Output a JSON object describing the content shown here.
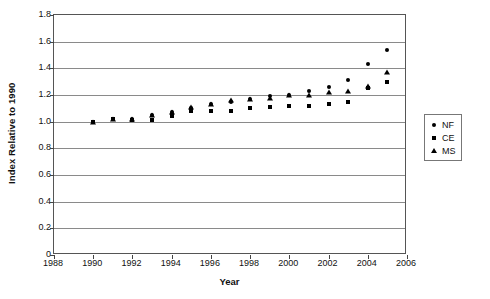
{
  "chart_data": {
    "type": "scatter",
    "title": "",
    "xlabel": "Year",
    "ylabel": "Index Relative to 1990",
    "xlim": [
      1988,
      2006
    ],
    "ylim": [
      0,
      1.8
    ],
    "xticks": [
      1988,
      1990,
      1992,
      1994,
      1996,
      1998,
      2000,
      2002,
      2004,
      2006
    ],
    "yticks": [
      "0",
      "0.2",
      "0.4",
      "0.6",
      "0.8",
      "1.0",
      "1.2",
      "1.4",
      "1.6",
      "1.8"
    ],
    "grid": "horizontal",
    "legend_position": "right-outside",
    "legend": [
      "NF",
      "CE",
      "MS"
    ],
    "x": [
      1990,
      1991,
      1992,
      1993,
      1994,
      1995,
      1996,
      1997,
      1998,
      1999,
      2000,
      2001,
      2002,
      2003,
      2004,
      2005
    ],
    "series": [
      {
        "name": "NF",
        "marker": "circle",
        "values": [
          1.0,
          1.02,
          1.02,
          1.05,
          1.07,
          1.1,
          1.13,
          1.15,
          1.17,
          1.19,
          1.2,
          1.23,
          1.26,
          1.31,
          1.43,
          1.54
        ]
      },
      {
        "name": "CE",
        "marker": "square",
        "values": [
          1.0,
          1.02,
          1.01,
          1.01,
          1.04,
          1.08,
          1.08,
          1.08,
          1.1,
          1.11,
          1.12,
          1.12,
          1.13,
          1.15,
          1.25,
          1.3
        ]
      },
      {
        "name": "MS",
        "marker": "triangle",
        "values": [
          1.0,
          1.02,
          1.02,
          1.05,
          1.07,
          1.11,
          1.13,
          1.16,
          1.17,
          1.18,
          1.2,
          1.2,
          1.22,
          1.23,
          1.27,
          1.37
        ]
      }
    ]
  },
  "legend": {
    "items": [
      {
        "label": "NF",
        "marker": "circle-marker-icon"
      },
      {
        "label": "CE",
        "marker": "square-marker-icon"
      },
      {
        "label": "MS",
        "marker": "triangle-marker-icon"
      }
    ]
  },
  "axes": {
    "y_title": "Index Relative to 1990",
    "x_title": "Year"
  }
}
